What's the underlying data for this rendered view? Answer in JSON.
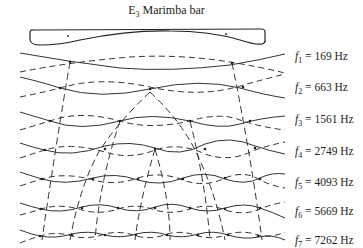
{
  "title": {
    "element": "E",
    "subscript": "3",
    "text": " Marimba bar"
  },
  "modes": [
    {
      "name": "f",
      "index": "1",
      "value": "169",
      "unit": "Hz",
      "label": " = 169 Hz",
      "y": 57
    },
    {
      "name": "f",
      "index": "2",
      "value": "663",
      "unit": "Hz",
      "label": " = 663 Hz",
      "y": 88
    },
    {
      "name": "f",
      "index": "3",
      "value": "1561",
      "unit": "Hz",
      "label": " = 1561 Hz",
      "y": 120
    },
    {
      "name": "f",
      "index": "4",
      "value": "2749",
      "unit": "Hz",
      "label": " = 2749 Hz",
      "y": 152
    },
    {
      "name": "f",
      "index": "5",
      "value": "4093",
      "unit": "Hz",
      "label": " = 4093 Hz",
      "y": 183
    },
    {
      "name": "f",
      "index": "6",
      "value": "5669",
      "unit": "Hz",
      "label": " = 5669 Hz",
      "y": 212
    },
    {
      "name": "f",
      "index": "7",
      "value": "7262",
      "unit": "Hz",
      "label": " = 7262 Hz",
      "y": 241
    }
  ],
  "colors": {
    "ink": "#222222",
    "background": "#ffffff"
  }
}
